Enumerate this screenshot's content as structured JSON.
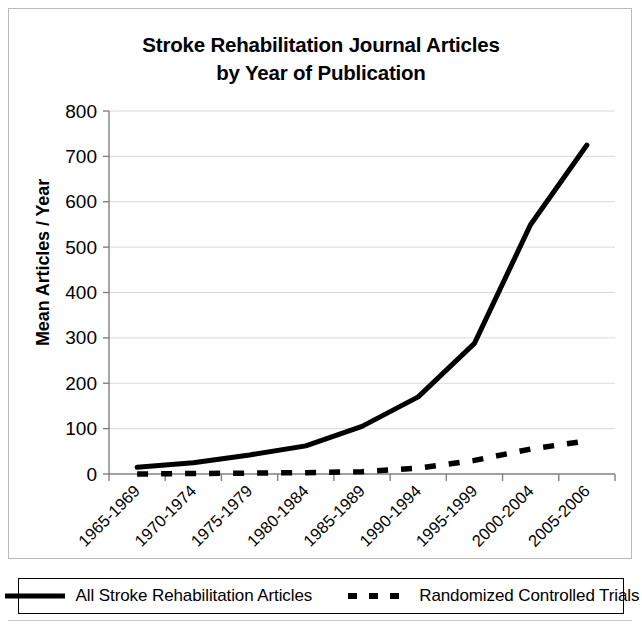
{
  "chart_data": {
    "type": "line",
    "title": "Stroke Rehabilitation Journal Articles by Year of Publication",
    "title_line1": "Stroke Rehabilitation Journal Articles",
    "title_line2": "by Year of Publication",
    "xlabel": "",
    "ylabel": "Mean Articles / Year",
    "ylim": [
      0,
      800
    ],
    "ytick_values": [
      0,
      100,
      200,
      300,
      400,
      500,
      600,
      700,
      800
    ],
    "ytick_labels": [
      "0",
      "100",
      "200",
      "300",
      "400",
      "500",
      "600",
      "700",
      "800"
    ],
    "grid": true,
    "grid_axis": "y",
    "legend_position": "bottom",
    "categories": [
      "1965-1969",
      "1970-1974",
      "1975-1979",
      "1980-1984",
      "1985-1989",
      "1990-1994",
      "1995-1999",
      "2000-2004",
      "2005-2006"
    ],
    "series": [
      {
        "name": "All Stroke Rehabilitation Articles",
        "style": "solid",
        "color": "#000000",
        "values": [
          15,
          25,
          42,
          62,
          105,
          170,
          288,
          550,
          725
        ]
      },
      {
        "name": "Randomized Controlled Trials",
        "style": "dashed",
        "color": "#000000",
        "values": [
          0,
          1,
          2,
          3,
          5,
          13,
          30,
          55,
          73
        ]
      }
    ]
  },
  "legend": {
    "items": [
      {
        "label": "All Stroke Rehabilitation Articles",
        "style": "solid"
      },
      {
        "label": "Randomized Controlled Trials",
        "style": "dashed"
      }
    ]
  },
  "colors": {
    "series": "#000000",
    "axis": "#808080",
    "grid": "#d9d9d9",
    "frame": "#b9b9b9",
    "background": "#ffffff"
  }
}
